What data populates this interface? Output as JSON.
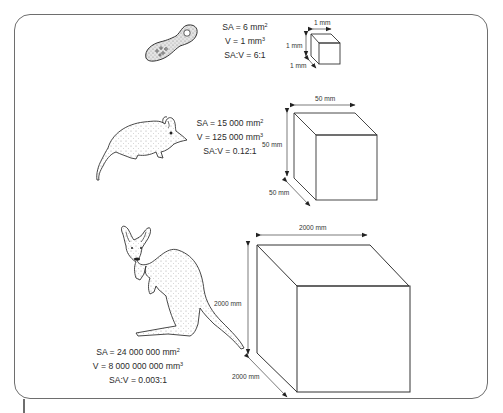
{
  "diagram": {
    "topic": "Surface area to volume ratio decreases as size increases",
    "rows": [
      {
        "organism": "amoeba",
        "stats": {
          "sa_prefix": "SA = 6 mm",
          "sa_exp": "2",
          "v_prefix": "V = 1 mm",
          "v_exp": "3",
          "ratio": "SA:V = 6:1"
        },
        "cube": {
          "width_label": "1 mm",
          "height_label": "1 mm",
          "depth_label": "1 mm"
        }
      },
      {
        "organism": "small-marsupial-mouse",
        "stats": {
          "sa_prefix": "SA = 15 000 mm",
          "sa_exp": "2",
          "v_prefix": "V = 125 000 mm",
          "v_exp": "3",
          "ratio": "SA:V = 0.12:1"
        },
        "cube": {
          "width_label": "50 mm",
          "height_label": "50 mm",
          "depth_label": "50 mm"
        }
      },
      {
        "organism": "kangaroo",
        "stats": {
          "sa_prefix": "SA = 24 000 000 mm",
          "sa_exp": "2",
          "v_prefix": "V = 8 000 000 000 mm",
          "v_exp": "3",
          "ratio": "SA:V = 0.003:1"
        },
        "cube": {
          "width_label": "2000 mm",
          "height_label": "2000 mm",
          "depth_label": "2000 mm"
        }
      }
    ],
    "colors": {
      "line": "#3a3a3a",
      "frame": "#6e6e6e",
      "stipple": "#cfcfcf"
    }
  }
}
